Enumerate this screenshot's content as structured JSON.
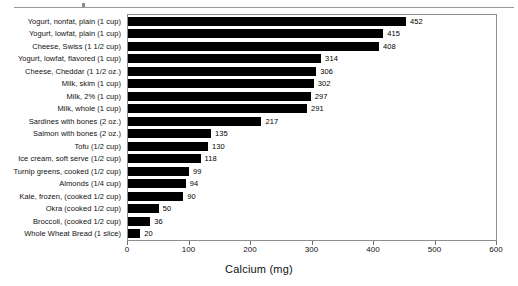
{
  "chart_data": {
    "type": "bar",
    "orientation": "horizontal",
    "title": "",
    "xlabel": "Calcium (mg)",
    "ylabel": "",
    "xlim": [
      0,
      600
    ],
    "xticks": [
      0,
      100,
      200,
      300,
      400,
      500,
      600
    ],
    "grid": false,
    "legend": null,
    "bar_color": "#000000",
    "categories": [
      "Yogurt, nonfat, plain (1 cup)",
      "Yogurt, lowfat, plain (1 cup)",
      "Cheese, Swiss (1 1/2 cup)",
      "Yogurt, lowfat, flavored (1 cup)",
      "Cheese, Cheddar (1 1/2 oz.)",
      "Milk, skim (1 cup)",
      "Milk, 2% (1 cup)",
      "Milk, whole (1 cup)",
      "Sardines with bones (2 oz.)",
      "Salmon with bones (2 oz.)",
      "Tofu (1/2 cup)",
      "Ice cream, soft serve (1/2 cup)",
      "Turnip greens, cooked (1/2 cup)",
      "Almonds (1/4 cup)",
      "Kale, frozen, (cooked 1/2 cup)",
      "Okra (cooked 1/2 cup)",
      "Broccoli, (cooked 1/2 cup)",
      "Whole Wheat Bread (1 slice)"
    ],
    "values": [
      452,
      415,
      408,
      314,
      306,
      302,
      297,
      291,
      217,
      135,
      130,
      118,
      99,
      94,
      90,
      50,
      36,
      20
    ],
    "value_labels": [
      "452",
      "415",
      "408",
      "314",
      "306",
      "302",
      "297",
      "291",
      "217",
      "135",
      "130",
      "118",
      "99",
      "94",
      "90",
      "50",
      "36",
      "20"
    ],
    "xtick_labels": [
      "0",
      "100",
      "200",
      "300",
      "400",
      "500",
      "600"
    ]
  }
}
